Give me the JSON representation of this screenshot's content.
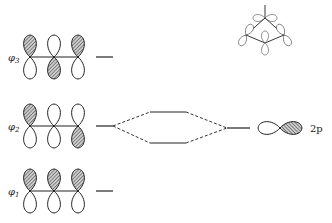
{
  "diagram": {
    "type": "molecular-orbital-energy-diagram",
    "orbitals": [
      {
        "label": "φ3",
        "sub": "3",
        "phases": [
          "+",
          "-",
          "+"
        ]
      },
      {
        "label": "φ2",
        "sub": "2",
        "phases": [
          "+",
          "0",
          "-"
        ]
      },
      {
        "label": "φ1",
        "sub": "1",
        "phases": [
          "+",
          "+",
          "+"
        ]
      }
    ],
    "atomic_orbital_label": "2p",
    "colors": {
      "line": "#222222",
      "shade": "#555555",
      "background": "#ffffff"
    }
  }
}
